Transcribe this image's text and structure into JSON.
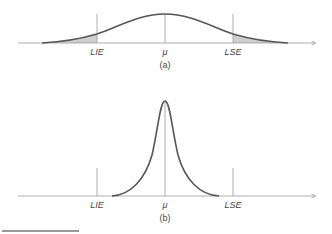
{
  "panels": [
    {
      "id": "a",
      "caption": "(a)",
      "labels": {
        "lower": "LIE",
        "center": "μ",
        "upper": "LSE"
      },
      "description": "Wide normal distribution; shaded tails outside LIE and LSE"
    },
    {
      "id": "b",
      "caption": "(b)",
      "labels": {
        "lower": "LIE",
        "center": "μ",
        "upper": "LSE"
      },
      "description": "Narrow peaked distribution fully inside LIE and LSE"
    }
  ],
  "colors": {
    "curve": "#555555",
    "axis": "#9a9a9a",
    "shade": "#cfcfcf",
    "text": "#444444"
  }
}
